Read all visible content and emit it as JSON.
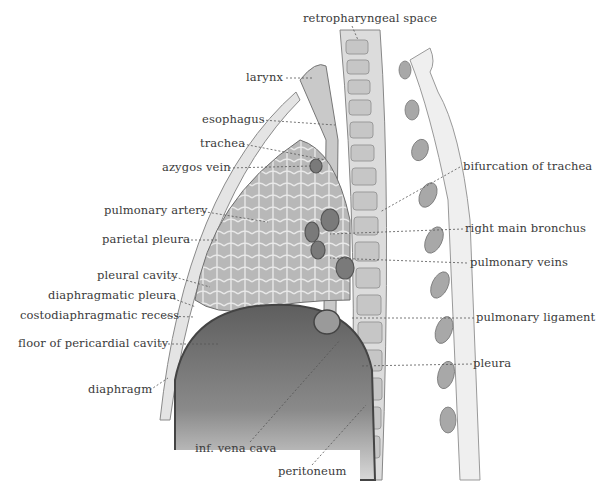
{
  "figure": {
    "labels": {
      "retropharyngeal_space": "retropharyngeal space",
      "larynx": "larynx",
      "esophagus": "esophagus",
      "trachea": "trachea",
      "azygos_vein": "azygos vein",
      "bifurcation_of_trachea": "bifurcation of trachea",
      "pulmonary_artery": "pulmonary artery",
      "right_main_bronchus": "right main bronchus",
      "parietal_pleura": "parietal pleura",
      "pulmonary_veins": "pulmonary veins",
      "pleural_cavity": "pleural cavity",
      "diaphragmatic_pleura": "diaphragmatic pleura",
      "costodiaphragmatic_recess": "costodiaphragmatic recess",
      "pulmonary_ligament": "pulmonary ligament",
      "floor_of_pericardial_cavity": "floor of pericardial cavity",
      "pleura": "pleura",
      "diaphragm": "diaphragm",
      "inf_vena_cava": "inf. vena cava",
      "peritoneum": "peritoneum"
    }
  }
}
